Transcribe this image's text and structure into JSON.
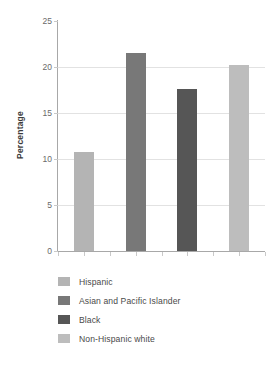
{
  "chart_data": {
    "type": "bar",
    "title": "",
    "subtitle": "",
    "xlabel": "",
    "ylabel": "Percentage",
    "ylim": [
      0,
      25
    ],
    "yticks": [
      0,
      5,
      10,
      15,
      20,
      25
    ],
    "ytick_labels": [
      "0",
      "5",
      "10",
      "15",
      "20",
      "25"
    ],
    "grid": true,
    "grid_axis": "y",
    "legend_position": "below",
    "xtick_labels": [],
    "categories": [
      "Hispanic",
      "Asian and Pacific Islander",
      "Black",
      "Non-Hispanic white"
    ],
    "values": [
      10.8,
      21.5,
      17.6,
      20.2
    ],
    "colors": [
      "#b4b4b4",
      "#787878",
      "#565656",
      "#bdbdbd"
    ],
    "series": [
      {
        "name": "Percentage",
        "values": [
          10.8,
          21.5,
          17.6,
          20.2
        ]
      }
    ]
  },
  "legend": {
    "items": [
      {
        "label": "Hispanic",
        "color": "#b4b4b4"
      },
      {
        "label": "Asian and Pacific Islander",
        "color": "#787878"
      },
      {
        "label": "Black",
        "color": "#565656"
      },
      {
        "label": "Non-Hispanic white",
        "color": "#bdbdbd"
      }
    ]
  }
}
